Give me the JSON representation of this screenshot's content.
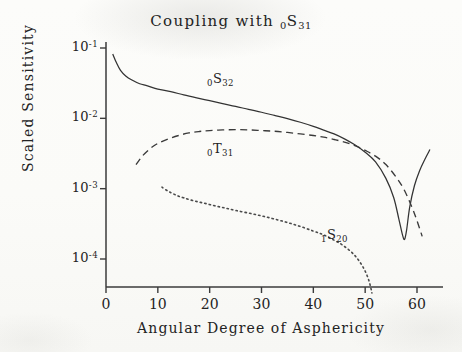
{
  "chart_data": {
    "type": "line",
    "title": "Coupling with 0S31",
    "title_parts": {
      "lead": "Coupling with",
      "mode_sub": "0",
      "mode_base": "S",
      "mode_sup": "31"
    },
    "xlabel": "Angular Degree of Asphericity",
    "ylabel": "Scaled Sensitivity",
    "xlim": [
      0,
      63
    ],
    "ylim": [
      3e-05,
      0.1
    ],
    "yscale": "log",
    "xscale": "linear",
    "grid": false,
    "legend_position": "inline-annotations",
    "xticks": [
      0,
      10,
      20,
      30,
      40,
      50,
      60
    ],
    "xtick_labels": [
      "0",
      "10",
      "20",
      "30",
      "40",
      "50",
      "60"
    ],
    "yticks": [
      0.1,
      0.01,
      0.001,
      0.0001
    ],
    "ytick_labels": [
      "10-1",
      "10-2",
      "10-3",
      "10-4"
    ],
    "ytick_parts": [
      {
        "base": "10",
        "exp": "-1"
      },
      {
        "base": "10",
        "exp": "-2"
      },
      {
        "base": "10",
        "exp": "-3"
      },
      {
        "base": "10",
        "exp": "-4"
      }
    ],
    "series": [
      {
        "name": "0S32",
        "label_parts": {
          "sub": "0",
          "base": "S",
          "sup": "32"
        },
        "style": "solid",
        "color": "#333333",
        "label_x": 19.5,
        "label_y": 0.035,
        "x": [
          1.3,
          2.0,
          2.8,
          3.8,
          5.0,
          6.5,
          8.0,
          10.0,
          12.5,
          15.0,
          17.5,
          20.0,
          22.5,
          25.0,
          27.5,
          30.0,
          32.5,
          35.0,
          37.5,
          40.0,
          42.0,
          44.0,
          46.0,
          48.0,
          50.0,
          52.0,
          54.0,
          55.5,
          56.5,
          57.2,
          57.6,
          58.0,
          58.6,
          59.5,
          60.5,
          61.5,
          62.5
        ],
        "y": [
          0.082,
          0.062,
          0.048,
          0.04,
          0.035,
          0.031,
          0.029,
          0.026,
          0.024,
          0.0215,
          0.0195,
          0.0178,
          0.0162,
          0.0148,
          0.0134,
          0.0122,
          0.011,
          0.0099,
          0.0088,
          0.0077,
          0.0068,
          0.006,
          0.0051,
          0.0042,
          0.0033,
          0.0024,
          0.0014,
          0.00075,
          0.00037,
          0.00022,
          0.00019,
          0.00026,
          0.00055,
          0.0011,
          0.0018,
          0.0026,
          0.0036
        ]
      },
      {
        "name": "0T31",
        "label_parts": {
          "sub": "0",
          "base": "T",
          "sup": "31"
        },
        "style": "dashed",
        "color": "#3a3a3a",
        "label_x": 19.5,
        "label_y": 0.0036,
        "x": [
          5.8,
          7.0,
          8.5,
          10.0,
          12.0,
          14.0,
          16.0,
          18.0,
          20.0,
          22.5,
          25.0,
          27.5,
          30.0,
          32.5,
          35.0,
          37.5,
          40.0,
          42.0,
          44.0,
          46.0,
          48.0,
          50.0,
          52.0,
          54.0,
          56.0,
          57.5,
          59.0,
          60.0,
          61.0
        ],
        "y": [
          0.0022,
          0.0029,
          0.0037,
          0.0044,
          0.0051,
          0.0057,
          0.0062,
          0.0065,
          0.0067,
          0.00685,
          0.0069,
          0.00685,
          0.0067,
          0.00655,
          0.0063,
          0.006,
          0.0057,
          0.0054,
          0.005,
          0.0046,
          0.0041,
          0.0035,
          0.0029,
          0.0022,
          0.00145,
          0.00097,
          0.00055,
          0.00035,
          0.00021
        ]
      },
      {
        "name": "1S20",
        "label_parts": {
          "sub": "1",
          "base": "S",
          "sup": "20"
        },
        "style": "dotted",
        "color": "#4a4a4a",
        "label_x": 41.5,
        "label_y": 0.00021,
        "x": [
          10.8,
          12.0,
          13.5,
          15.0,
          17.0,
          19.0,
          21.0,
          23.0,
          25.0,
          27.5,
          30.0,
          32.5,
          35.0,
          37.5,
          40.0,
          42.0,
          44.0,
          45.5,
          47.0,
          48.2,
          49.2,
          50.0,
          50.6,
          51.0,
          51.3
        ],
        "y": [
          0.00105,
          0.00092,
          0.00081,
          0.00074,
          0.00067,
          0.00062,
          0.00057,
          0.00053,
          0.00049,
          0.00045,
          0.00041,
          0.00037,
          0.00033,
          0.00029,
          0.00025,
          0.00022,
          0.000185,
          0.00016,
          0.000132,
          0.000108,
          8.55e-05,
          6.7e-05,
          5.25e-05,
          4.15e-05,
          3.3e-05
        ]
      }
    ]
  }
}
